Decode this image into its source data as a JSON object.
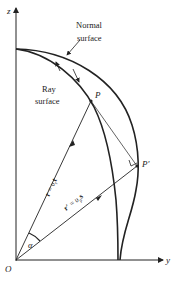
{
  "diagram": {
    "axes": {
      "z_label": "z",
      "y_label": "y",
      "origin_label": "O"
    },
    "surfaces": {
      "normal": {
        "line1": "Normal",
        "line2": "surface"
      },
      "ray": {
        "line1": "Ray",
        "line2": "surface"
      }
    },
    "points": {
      "P": "P",
      "P_prime": "P′"
    },
    "vectors": {
      "r": {
        "lhs": "r",
        "eq": " = ",
        "v": "υ",
        "sub": "r",
        "t": "t"
      },
      "r_prime": {
        "lhs": "r′",
        "eq": " = ",
        "v": "υ",
        "sub": "p",
        "s": "s"
      }
    },
    "angle_label": "α",
    "colors": {
      "line": "#222222",
      "background": "#ffffff"
    }
  }
}
